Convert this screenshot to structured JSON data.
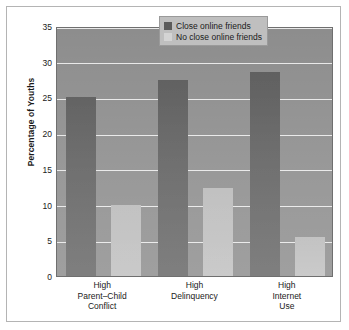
{
  "chart_data": {
    "type": "bar",
    "title": "",
    "subtitle": "",
    "xlabel": "",
    "ylabel": "Percentage of Youths",
    "ylim": [
      0,
      35
    ],
    "ytick_step": 5,
    "yticks": [
      "35",
      "30",
      "25",
      "20",
      "15",
      "10",
      "5",
      "0"
    ],
    "grid": true,
    "grid_axis": "y",
    "legend_position": "top-right",
    "categories": [
      "High\nParent–Child\nConflict",
      "High\nDelinquency",
      "High\nInternet\nUse"
    ],
    "category_lines": [
      [
        "High",
        "Parent–Child",
        "Conflict"
      ],
      [
        "High",
        "Delinquency"
      ],
      [
        "High",
        "Internet",
        "Use"
      ]
    ],
    "series": [
      {
        "name": "Close online friends",
        "color": "#5b5b5b",
        "values": [
          25.0,
          27.5,
          28.5
        ]
      },
      {
        "name": "No close online friends",
        "color": "#b9b9b9",
        "values": [
          10.0,
          12.3,
          5.5
        ]
      }
    ],
    "plot_background": "#8d8d8d",
    "gridline_color": "#e8e8e8"
  },
  "legend": {
    "items": [
      {
        "label": "Close online friends",
        "swatch": "dark"
      },
      {
        "label": "No close online friends",
        "swatch": "light"
      }
    ]
  },
  "axes": {
    "y_title": "Percentage of Youths"
  }
}
